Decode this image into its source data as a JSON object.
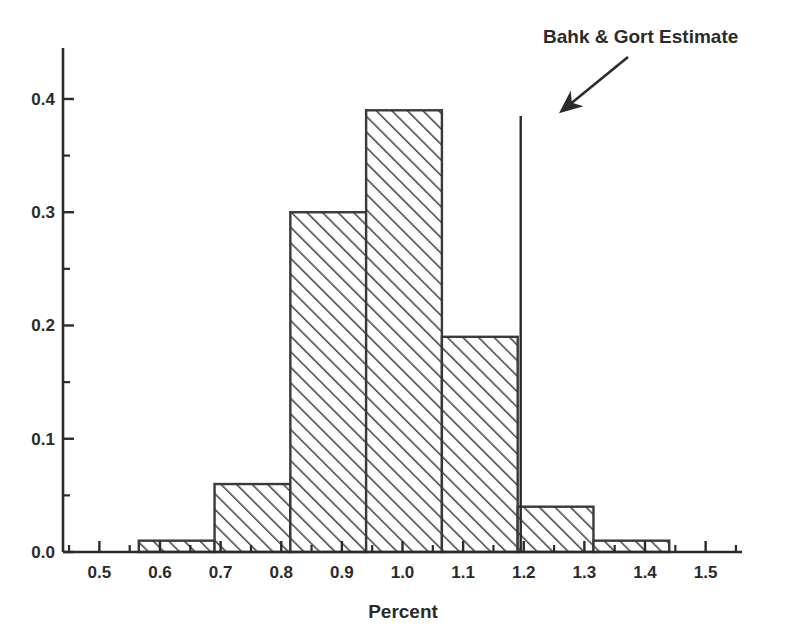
{
  "chart_data": {
    "type": "bar",
    "title": "",
    "subtitle": "",
    "xlabel": "Percent",
    "ylabel": "",
    "xlim": [
      0.44,
      1.56
    ],
    "ylim": [
      0.0,
      0.445
    ],
    "grid": false,
    "legend": null,
    "legend_position": "none",
    "x_tick_labels": [
      "0.5",
      "0.6",
      "0.7",
      "0.8",
      "0.9",
      "1.0",
      "1.1",
      "1.2",
      "1.3",
      "1.4",
      "1.5"
    ],
    "x_tick_values": [
      0.5,
      0.6,
      0.7,
      0.8,
      0.9,
      1.0,
      1.1,
      1.2,
      1.3,
      1.4,
      1.5
    ],
    "x_minor_tick_values": [
      0.45,
      0.55,
      0.65,
      0.75,
      0.85,
      0.95,
      1.05,
      1.15,
      1.25,
      1.35,
      1.45,
      1.55
    ],
    "y_tick_labels": [
      "0.0",
      "0.1",
      "0.2",
      "0.3",
      "0.4"
    ],
    "y_tick_values": [
      0.0,
      0.1,
      0.2,
      0.3,
      0.4
    ],
    "y_minor_tick_values": [
      0.05,
      0.15,
      0.25,
      0.35
    ],
    "bin_edges": [
      0.565,
      0.69,
      0.815,
      0.94,
      1.065,
      1.19,
      1.315,
      1.44
    ],
    "categories": [
      "0.565-0.690",
      "0.690-0.815",
      "0.815-0.940",
      "0.940-1.065",
      "1.065-1.190",
      "1.190-1.315",
      "1.315-1.440"
    ],
    "values": [
      0.01,
      0.06,
      0.3,
      0.39,
      0.19,
      0.04,
      0.01
    ],
    "bar_fill": "hatch-diagonal",
    "bar_edge_color": "#3a3a3a",
    "annotations": [
      {
        "name": "bahk-gort-estimate",
        "label": "Bahk & Gort Estimate",
        "x_value": 1.195,
        "y_top": 0.385,
        "marker": "vertical-line",
        "arrow": true,
        "color": "#2b2b2b"
      }
    ]
  },
  "figure": {
    "axis_color": "#2b2b2b",
    "background": "#ffffff"
  }
}
